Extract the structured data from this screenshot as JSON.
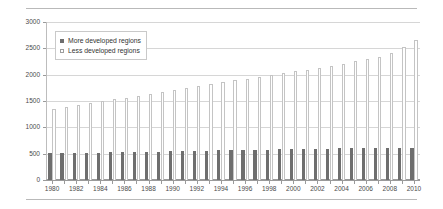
{
  "chart_data": {
    "type": "bar",
    "title": "",
    "subtitle": "",
    "xlabel": "",
    "ylabel": "millions",
    "ylim": [
      0,
      3000
    ],
    "ytick_step": 500,
    "yticks": [
      "0",
      "500",
      "1000",
      "1500",
      "2000",
      "2500",
      "3000"
    ],
    "grid": true,
    "legend_position": "top-left",
    "categories": [
      "1980",
      "1981",
      "1982",
      "1983",
      "1984",
      "1985",
      "1986",
      "1987",
      "1988",
      "1989",
      "1990",
      "1991",
      "1992",
      "1993",
      "1994",
      "1995",
      "1996",
      "1997",
      "1998",
      "1999",
      "2000",
      "2001",
      "2002",
      "2003",
      "2004",
      "2005",
      "2006",
      "2007",
      "2008",
      "2009",
      "2010"
    ],
    "xtick_labels": [
      "1980",
      "1982",
      "1984",
      "1986",
      "1988",
      "1990",
      "1992",
      "1994",
      "1996",
      "1998",
      "2000",
      "2002",
      "2004",
      "2006",
      "2008",
      "2010"
    ],
    "series": [
      {
        "name": "More developed regions",
        "color": "#6e6e6e",
        "values": [
          510,
          512,
          515,
          518,
          521,
          524,
          528,
          532,
          536,
          540,
          545,
          549,
          553,
          557,
          561,
          565,
          569,
          573,
          577,
          581,
          585,
          589,
          592,
          596,
          599,
          602,
          605,
          608,
          610,
          612,
          614
        ]
      },
      {
        "name": "Less developed regions",
        "color": "#ffffff",
        "values": [
          1355,
          1390,
          1425,
          1460,
          1495,
          1530,
          1566,
          1602,
          1638,
          1675,
          1712,
          1748,
          1784,
          1820,
          1855,
          1890,
          1925,
          1960,
          1994,
          2028,
          2062,
          2098,
          2135,
          2173,
          2212,
          2252,
          2296,
          2345,
          2420,
          2520,
          2650
        ]
      }
    ]
  },
  "legend": {
    "items": [
      {
        "label": "More developed regions",
        "marker": "filled-square-marker"
      },
      {
        "label": "Less developed regions",
        "marker": "outlined-square-marker"
      }
    ]
  },
  "axes": {
    "y_axis_title": "millions"
  }
}
